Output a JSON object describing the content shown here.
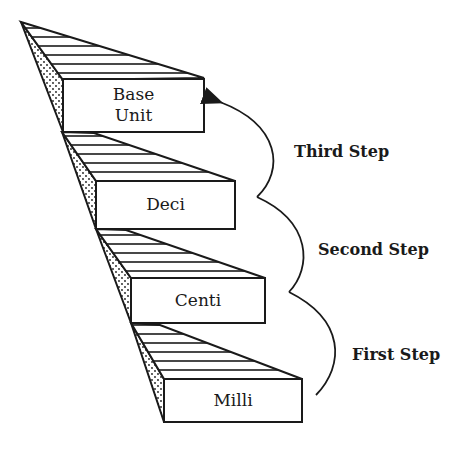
{
  "diagram": {
    "type": "staircase",
    "colors": {
      "line": "#1a1a1a",
      "background": "#ffffff"
    },
    "steps": [
      {
        "label_line1": "Base",
        "label_line2": "Unit"
      },
      {
        "label": "Deci"
      },
      {
        "label": "Centi"
      },
      {
        "label": "Milli"
      }
    ],
    "arrows": [
      {
        "label": "Third Step",
        "from": "Deci",
        "to": "Base Unit"
      },
      {
        "label": "Second Step",
        "from": "Centi",
        "to": "Deci"
      },
      {
        "label": "First Step",
        "from": "Milli",
        "to": "Centi"
      }
    ]
  }
}
